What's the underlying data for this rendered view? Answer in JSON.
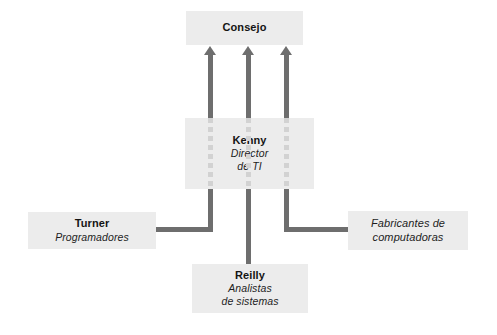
{
  "diagram": {
    "colors": {
      "box_fill": "#ececec",
      "connector": "#6e6e6e",
      "dashed_connector": "#d2d2d2",
      "background": "#ffffff",
      "text": "#141414"
    },
    "nodes": [
      {
        "id": "consejo",
        "title": "Consejo",
        "subtitle": "",
        "subtitle2": ""
      },
      {
        "id": "kenny",
        "title": "Kenny",
        "subtitle": "Director",
        "subtitle2": "de TI"
      },
      {
        "id": "turner",
        "title": "Turner",
        "subtitle": "Programadores",
        "subtitle2": ""
      },
      {
        "id": "reilly",
        "title": "Reilly",
        "subtitle": "Analistas",
        "subtitle2": "de sistemas"
      },
      {
        "id": "vendors",
        "title": "",
        "subtitle": "Fabricantes de",
        "subtitle2": "computadoras"
      }
    ],
    "connectors": [
      {
        "id": "kenny-to-consejo-1",
        "from": "kenny",
        "to": "consejo",
        "style": "arrow-up"
      },
      {
        "id": "kenny-to-consejo-2",
        "from": "kenny",
        "to": "consejo",
        "style": "arrow-up"
      },
      {
        "id": "kenny-to-consejo-3",
        "from": "kenny",
        "to": "consejo",
        "style": "arrow-up"
      },
      {
        "id": "kenny-to-turner",
        "from": "kenny",
        "to": "turner",
        "style": "elbow-left"
      },
      {
        "id": "kenny-to-vendors",
        "from": "kenny",
        "to": "vendors",
        "style": "elbow-right"
      },
      {
        "id": "kenny-to-reilly",
        "from": "kenny",
        "to": "reilly",
        "style": "straight-down"
      }
    ]
  }
}
